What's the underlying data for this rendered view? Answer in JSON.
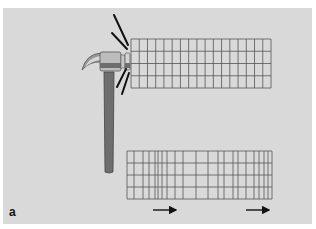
{
  "figure": {
    "panel_label": "a",
    "background_color": "#d9d9d9",
    "line_color": "#555555"
  },
  "hammer": {
    "description": "claw hammer striking the left end of a rod",
    "handle_color": "#6e6e6e",
    "head_color": "#b8b8b8",
    "impact_lines": 4
  },
  "top_grid": {
    "description": "undisturbed grid (uniform spacing)",
    "x": [
      131,
      271
    ],
    "y": [
      39,
      88
    ],
    "rows": 4,
    "columns": 17
  },
  "bottom_grid": {
    "description": "grid with compression wave (non-uniform column spacing)",
    "x": [
      127,
      272
    ],
    "y": [
      151,
      199
    ],
    "rows": 4,
    "column_lines_x": [
      127,
      134,
      143,
      149,
      155,
      158,
      162,
      167,
      175,
      183,
      196,
      208,
      218,
      224,
      233,
      238,
      246,
      254,
      259,
      264,
      268,
      272
    ]
  },
  "arrows": [
    {
      "name": "arrow-1",
      "x1": 153,
      "x2": 179,
      "y": 210
    },
    {
      "name": "arrow-2",
      "x1": 246,
      "x2": 272,
      "y": 210
    }
  ]
}
